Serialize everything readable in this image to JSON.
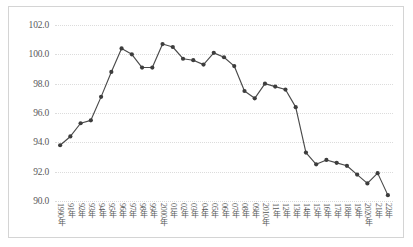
{
  "chart_data": {
    "type": "line",
    "title": "",
    "subtitle": "",
    "xlabel": "",
    "ylabel": "",
    "ylim": [
      90.0,
      102.0
    ],
    "ytick_step": 2.0,
    "ytick_labels": [
      "102.0",
      "100.0",
      "98.0",
      "96.0",
      "94.0",
      "92.0",
      "90.0"
    ],
    "ytick_values": [
      102.0,
      100.0,
      98.0,
      96.0,
      94.0,
      92.0,
      90.0
    ],
    "grid": true,
    "grid_style": "dotted",
    "legend": "none",
    "marker": "circle",
    "line_color": "#4a4a4a",
    "marker_color": "#3d3d3d",
    "grid_color": "#dcdcdc",
    "border_color": "#d4d4d4",
    "categories": [
      "1990年",
      "91年",
      "92年",
      "93年",
      "94年",
      "95年",
      "96年",
      "97年",
      "98年",
      "99年",
      "2000年",
      "01年",
      "02年",
      "03年",
      "04年",
      "05年",
      "06年",
      "07年",
      "08年",
      "09年",
      "2010年",
      "11年",
      "12年",
      "13年",
      "14年",
      "15年",
      "16年",
      "17年",
      "18年",
      "19年",
      "2020年",
      "21年",
      "22年"
    ],
    "values": [
      93.8,
      94.4,
      95.3,
      95.5,
      97.1,
      98.8,
      100.4,
      100.0,
      99.1,
      99.1,
      100.7,
      100.5,
      99.7,
      99.6,
      99.3,
      100.1,
      99.8,
      99.2,
      97.5,
      97.0,
      98.0,
      97.8,
      97.6,
      96.4,
      93.3,
      92.5,
      92.8,
      92.6,
      92.4,
      91.8,
      91.2,
      91.9,
      90.4
    ]
  }
}
